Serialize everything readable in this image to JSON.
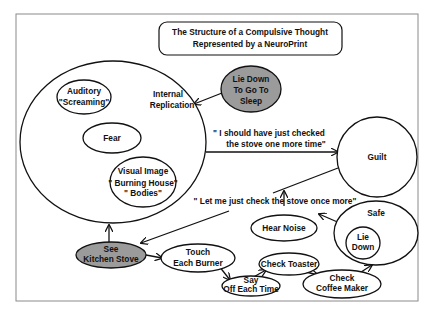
{
  "title": {
    "line1": "The Structure of a Compulsive Thought",
    "line2": "Represented by a NeuroPrint"
  },
  "colors": {
    "background": "#ffffff",
    "frame": "#8a8a8a",
    "stroke": "#111111",
    "shaded_node": "#9b9b9b"
  },
  "nodes": {
    "internal_replication": {
      "line1": "Internal",
      "line2": "Replication"
    },
    "auditory": {
      "line1": "Auditory",
      "line2": "\"Screaming\""
    },
    "fear": {
      "line1": "Fear"
    },
    "visual_image": {
      "line1": "Visual Image",
      "line2": "\" Burning House\"",
      "line3": "\" Bodies\""
    },
    "lie_down_sleep": {
      "line1": "Lie Down",
      "line2": "To Go To",
      "line3": "Sleep"
    },
    "guilt": {
      "line1": "Guilt"
    },
    "see_kitchen_stove": {
      "line1": "See",
      "line2": "Kitchen Stove"
    },
    "touch_each_burner": {
      "line1": "Touch",
      "line2": "Each Burner"
    },
    "say_off": {
      "line1": "Say",
      "line2": "Off Each Time"
    },
    "check_toaster": {
      "line1": "Check Toaster"
    },
    "check_coffee_maker": {
      "line1": "Check",
      "line2": "Coffee Maker"
    },
    "hear_noise": {
      "line1": "Hear Noise"
    },
    "safe": {
      "line1": "Safe"
    },
    "lie_down": {
      "line1": "Lie",
      "line2": "Down"
    }
  },
  "edge_labels": {
    "should_have_checked": {
      "line1": "\" I should have just checked",
      "line2": "the stove one more time\""
    },
    "let_me_check": "\" Let me just check the stove once more\""
  }
}
